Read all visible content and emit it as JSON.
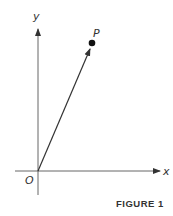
{
  "figure": {
    "caption": "FIGURE 1",
    "labels": {
      "y_axis": "y",
      "x_axis": "x",
      "origin": "O",
      "point": "P"
    },
    "colors": {
      "axis": "#555555",
      "vector": "#333333",
      "point": "#111111"
    }
  }
}
